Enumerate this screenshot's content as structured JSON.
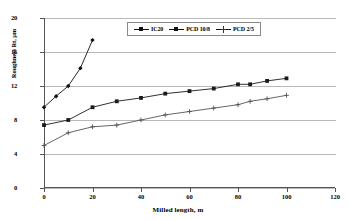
{
  "chart_data": {
    "type": "line",
    "title": "",
    "xlabel": "Milled length, m",
    "ylabel": "Roughness Rt, µm",
    "xlim": [
      0,
      120
    ],
    "ylim": [
      0,
      20
    ],
    "xticks": [
      0,
      20,
      40,
      60,
      80,
      100,
      120
    ],
    "yticks": [
      0,
      4,
      8,
      12,
      16,
      20
    ],
    "grid": "horizontal",
    "legend_position": "top-center-inside",
    "series": [
      {
        "name": "IC20",
        "marker": "filled-diamond",
        "color": "#111111",
        "x": [
          0,
          5,
          10,
          15,
          20
        ],
        "y": [
          9.5,
          10.8,
          12.0,
          14.1,
          17.4
        ]
      },
      {
        "name": "PCD 10/8",
        "marker": "filled-square",
        "color": "#1a1a1a",
        "x": [
          0,
          10,
          20,
          30,
          40,
          50,
          60,
          70,
          80,
          85,
          92,
          100
        ],
        "y": [
          7.4,
          8.0,
          9.5,
          10.2,
          10.6,
          11.1,
          11.4,
          11.7,
          12.2,
          12.2,
          12.6,
          12.9
        ]
      },
      {
        "name": "PCD 2/5",
        "marker": "cross",
        "color": "#555555",
        "x": [
          0,
          10,
          20,
          30,
          40,
          50,
          60,
          70,
          80,
          85,
          92,
          100
        ],
        "y": [
          5.0,
          6.5,
          7.2,
          7.4,
          8.0,
          8.6,
          9.0,
          9.4,
          9.8,
          10.2,
          10.5,
          10.9
        ]
      }
    ]
  },
  "legend": {
    "entries": [
      {
        "label": "IC20"
      },
      {
        "label": "PCD 10/8"
      },
      {
        "label": "PCD 2/5"
      }
    ]
  },
  "axes": {
    "y_tick_labels": [
      "20",
      "16",
      "12",
      "8",
      "4",
      "0"
    ],
    "x_tick_labels": [
      "0",
      "20",
      "40",
      "60",
      "80",
      "100",
      "120"
    ]
  }
}
